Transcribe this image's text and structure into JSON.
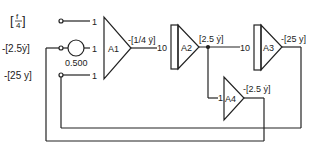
{
  "diagram": {
    "type": "analog computer block diagram",
    "inputs": [
      {
        "id": "in-f",
        "label_prefix": "",
        "label": "[f/4]",
        "frac_num": "f",
        "frac_den": "4",
        "gain": "1"
      },
      {
        "id": "in-ydot",
        "label": "-[2.5ẏ]",
        "gain": "1"
      },
      {
        "id": "in-y",
        "label": "-[25 y]",
        "gain": "1"
      }
    ],
    "potentiometer": {
      "label": "0.500"
    },
    "amplifiers": [
      {
        "id": "A1",
        "label": "A1",
        "kind": "summer",
        "output": "-[1/4 ÿ]"
      },
      {
        "id": "A2",
        "label": "A2",
        "kind": "integrator",
        "input_gain": "10",
        "output": "[2.5 ẏ]"
      },
      {
        "id": "A3",
        "label": "A3",
        "kind": "integrator",
        "input_gain": "10",
        "output": "-[25 y]"
      },
      {
        "id": "A4",
        "label": "A4",
        "kind": "inverter",
        "input_gain": "1",
        "output": "-[2.5 ẏ]"
      }
    ],
    "colors": {
      "line": "#222222",
      "background": "#ffffff"
    }
  }
}
